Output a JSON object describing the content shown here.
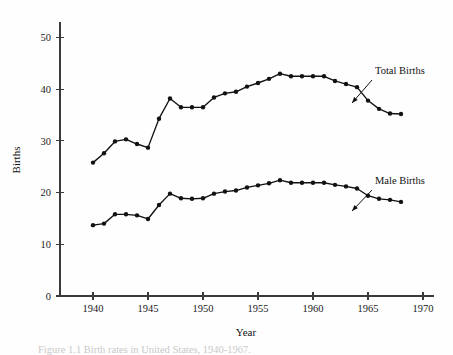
{
  "chart_data": {
    "type": "line",
    "title": "",
    "xlabel": "Year",
    "ylabel": "Births",
    "xlim": [
      1937,
      1971
    ],
    "ylim": [
      0,
      53
    ],
    "xticks": [
      1940,
      1945,
      1950,
      1955,
      1960,
      1965,
      1970
    ],
    "yticks": [
      0,
      10,
      20,
      30,
      40,
      50
    ],
    "grid": false,
    "legend_position": "inline-annotation",
    "markers": "filled-circle",
    "x": [
      1940,
      1941,
      1942,
      1943,
      1944,
      1945,
      1946,
      1947,
      1948,
      1949,
      1950,
      1951,
      1952,
      1953,
      1954,
      1955,
      1956,
      1957,
      1958,
      1959,
      1960,
      1961,
      1962,
      1963,
      1964,
      1965,
      1966,
      1967,
      1968
    ],
    "series": [
      {
        "name": "Total Births",
        "values": [
          25.8,
          27.6,
          29.9,
          30.3,
          29.4,
          28.7,
          34.3,
          38.2,
          36.5,
          36.5,
          36.5,
          38.4,
          39.2,
          39.5,
          40.5,
          41.2,
          42.0,
          43.0,
          42.5,
          42.5,
          42.5,
          42.5,
          41.6,
          41.0,
          40.4,
          37.8,
          36.2,
          35.3,
          35.2
        ]
      },
      {
        "name": "Male Births",
        "values": [
          13.7,
          14.0,
          15.8,
          15.8,
          15.6,
          14.9,
          17.6,
          19.8,
          18.9,
          18.8,
          18.9,
          19.8,
          20.2,
          20.4,
          21.0,
          21.4,
          21.8,
          22.4,
          21.9,
          21.9,
          21.9,
          21.9,
          21.5,
          21.2,
          20.8,
          19.4,
          18.8,
          18.6,
          18.2
        ]
      }
    ],
    "annotations": [
      {
        "name": "total-births-label",
        "label": "Total Births",
        "target_x": 1966,
        "target_y": 36.2
      },
      {
        "name": "male-births-label",
        "label": "Male Births",
        "target_x": 1968,
        "target_y": 18.2
      }
    ]
  },
  "axes": {
    "y_title": "Births",
    "x_title": "Year",
    "y_tick_labels": [
      "0",
      "10",
      "20",
      "30",
      "40",
      "50"
    ],
    "x_tick_labels": [
      "1940",
      "1945",
      "1950",
      "1955",
      "1960",
      "1965",
      "1970"
    ]
  },
  "annotations": {
    "total_births": "Total Births",
    "male_births": "Male Births"
  },
  "caption": {
    "text": "Figure 1.1  Birth rates in United States, 1940-1967."
  },
  "colors": {
    "ink": "#111111",
    "axis": "#3a3a3a",
    "background": "#fefefe"
  }
}
